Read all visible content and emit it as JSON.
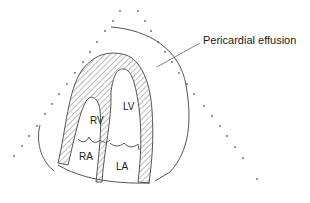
{
  "diagram": {
    "callout_label": "Pericardial effusion",
    "chambers": [
      {
        "id": "rv",
        "label": "RV"
      },
      {
        "id": "lv",
        "label": "LV"
      },
      {
        "id": "ra",
        "label": "RA"
      },
      {
        "id": "la",
        "label": "LA"
      }
    ],
    "colors": {
      "line": "#555555",
      "hatch": "#777777",
      "dots": "#666666",
      "text": "#1a1a1a",
      "background": "#ffffff"
    }
  }
}
